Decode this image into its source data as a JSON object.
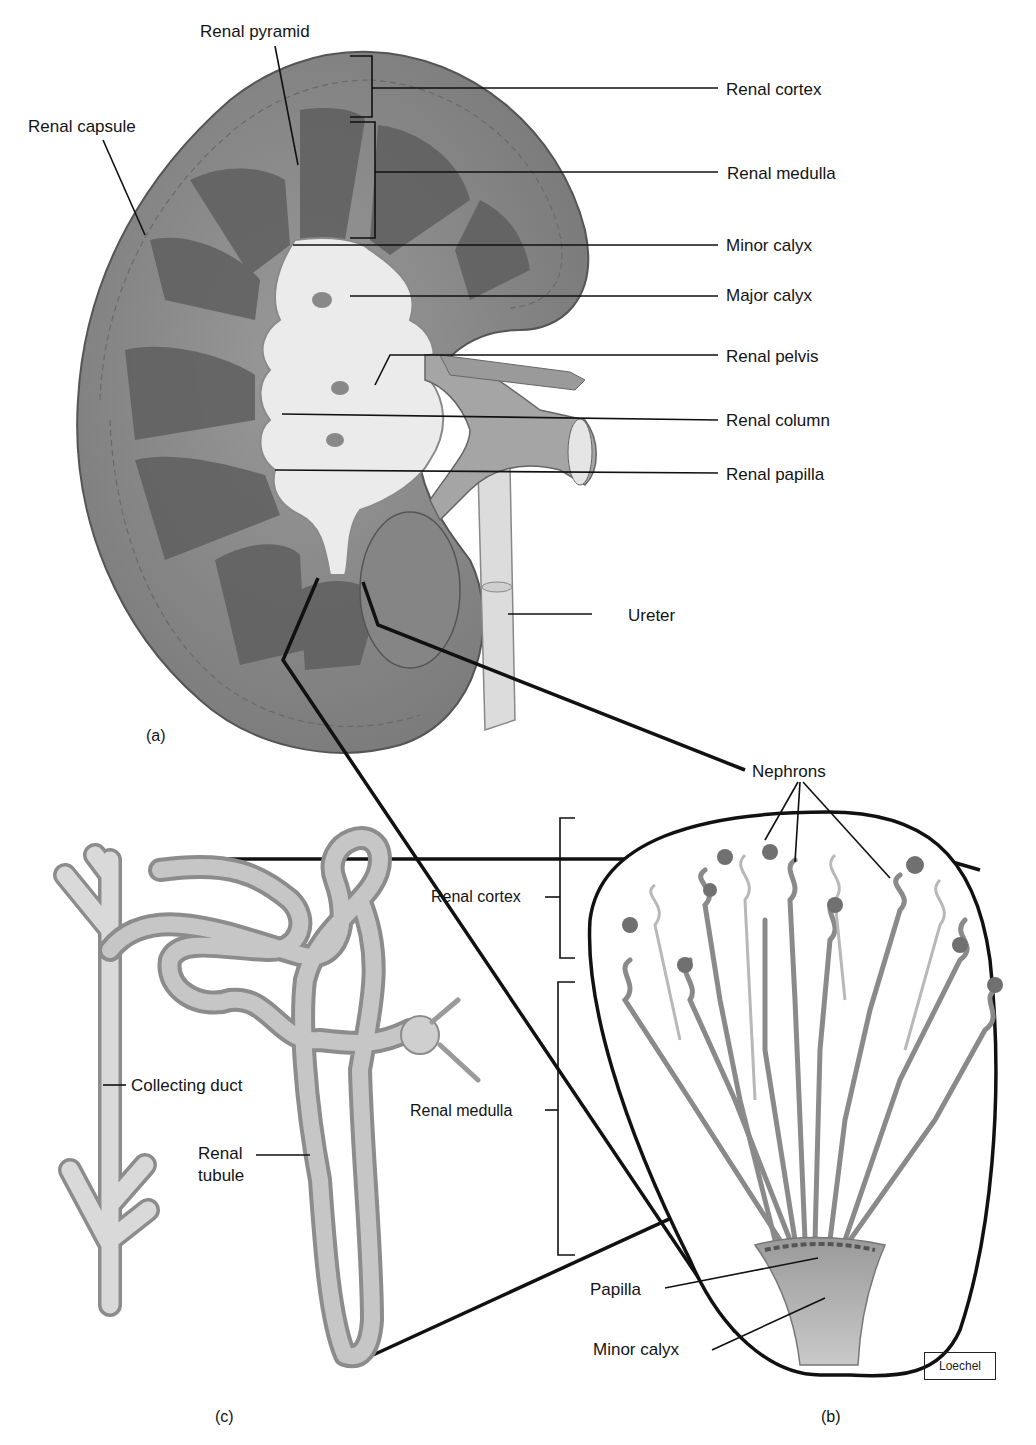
{
  "figure": {
    "panels": {
      "a": "(a)",
      "b": "(b)",
      "c": "(c)"
    },
    "credit": "Loechel"
  },
  "panel_a": {
    "title": "Kidney frontal section",
    "labels": {
      "renal_pyramid": "Renal pyramid",
      "renal_capsule": "Renal capsule",
      "renal_cortex": "Renal cortex",
      "renal_medulla": "Renal medulla",
      "minor_calyx": "Minor calyx",
      "major_calyx": "Major calyx",
      "renal_pelvis": "Renal pelvis",
      "renal_column": "Renal column",
      "renal_papilla": "Renal papilla",
      "ureter": "Ureter"
    }
  },
  "panel_b": {
    "title": "Renal pyramid enlargement",
    "labels": {
      "nephrons": "Nephrons",
      "renal_cortex": "Renal cortex",
      "renal_medulla": "Renal medulla",
      "papilla": "Papilla",
      "minor_calyx": "Minor calyx"
    }
  },
  "panel_c": {
    "title": "Nephron and collecting duct",
    "labels": {
      "collecting_duct": "Collecting duct",
      "renal_tubule_line1": "Renal",
      "renal_tubule_line2": "tubule"
    }
  },
  "colors": {
    "kidney_tissue": "#8a8a8a",
    "kidney_dark": "#5e5e5e",
    "pelvis_light": "#e8e8e8",
    "tubule": "#b9b9b9",
    "line": "#111111"
  }
}
